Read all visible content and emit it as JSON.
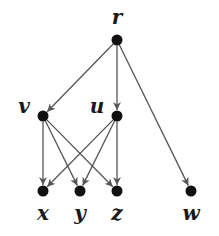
{
  "diagram": {
    "type": "directed-graph",
    "colors": {
      "node": "#111111",
      "edge": "#555555",
      "label": "#1a1a1a",
      "background": "#ffffff"
    },
    "nodes": [
      {
        "id": "r",
        "label": "r",
        "x": 117,
        "y": 40,
        "lx": 117,
        "ly": 24,
        "anchor": "middle"
      },
      {
        "id": "v",
        "label": "v",
        "x": 43,
        "y": 116,
        "lx": 24,
        "ly": 113,
        "anchor": "middle"
      },
      {
        "id": "u",
        "label": "u",
        "x": 117,
        "y": 116,
        "lx": 97,
        "ly": 113,
        "anchor": "middle"
      },
      {
        "id": "x",
        "label": "x",
        "x": 43,
        "y": 191,
        "lx": 43,
        "ly": 220,
        "anchor": "middle"
      },
      {
        "id": "y",
        "label": "y",
        "x": 80,
        "y": 191,
        "lx": 80,
        "ly": 220,
        "anchor": "middle"
      },
      {
        "id": "z",
        "label": "z",
        "x": 117,
        "y": 191,
        "lx": 117,
        "ly": 220,
        "anchor": "middle"
      },
      {
        "id": "w",
        "label": "w",
        "x": 191,
        "y": 191,
        "lx": 191,
        "ly": 220,
        "anchor": "middle"
      }
    ],
    "edges": [
      {
        "from": "r",
        "to": "v"
      },
      {
        "from": "r",
        "to": "u"
      },
      {
        "from": "r",
        "to": "w"
      },
      {
        "from": "v",
        "to": "x"
      },
      {
        "from": "v",
        "to": "y"
      },
      {
        "from": "v",
        "to": "z"
      },
      {
        "from": "u",
        "to": "x"
      },
      {
        "from": "u",
        "to": "y"
      },
      {
        "from": "u",
        "to": "z"
      }
    ]
  }
}
